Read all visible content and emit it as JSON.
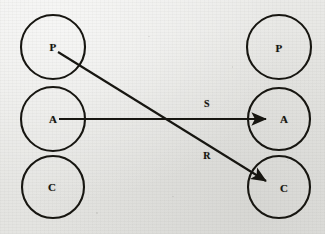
{
  "figure": {
    "background_color": "#e9e9e7",
    "ink_color": "#171611",
    "width": 325,
    "height": 234
  },
  "diagram_data": {
    "type": "diagram",
    "columns": [
      {
        "name": "left-column",
        "nodes": [
          {
            "id": "left-p",
            "label": "P",
            "cx": 53,
            "cy": 47,
            "r": 32
          },
          {
            "id": "left-a",
            "label": "A",
            "cx": 53,
            "cy": 119,
            "r": 32
          },
          {
            "id": "left-c",
            "label": "C",
            "cx": 53,
            "cy": 187,
            "r": 31
          }
        ]
      },
      {
        "name": "right-column",
        "nodes": [
          {
            "id": "right-p",
            "label": "P",
            "cx": 279,
            "cy": 47,
            "r": 32
          },
          {
            "id": "right-a",
            "label": "A",
            "cx": 279,
            "cy": 119,
            "r": 31
          },
          {
            "id": "right-c",
            "label": "C",
            "cx": 279,
            "cy": 187,
            "r": 31
          }
        ]
      }
    ],
    "edges": [
      {
        "id": "edge-s",
        "label": "S",
        "from": "left-a",
        "to": "right-a",
        "x1": 59,
        "y1": 119,
        "x2": 270,
        "y2": 119,
        "label_x": 207,
        "label_y": 104
      },
      {
        "id": "edge-r",
        "label": "R",
        "from": "left-p",
        "to": "right-c",
        "x1": 58,
        "y1": 52,
        "x2": 271,
        "y2": 184,
        "label_x": 207,
        "label_y": 156
      }
    ]
  },
  "labels": {
    "left_p": "P",
    "left_a": "A",
    "left_c": "C",
    "right_p": "P",
    "right_a": "A",
    "right_c": "C",
    "edge_s": "S",
    "edge_r": "R"
  }
}
